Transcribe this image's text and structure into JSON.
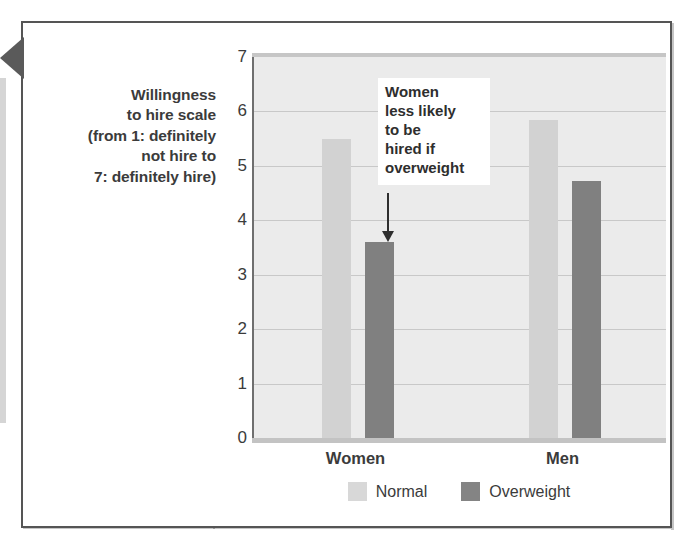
{
  "figure": {
    "axis_caption_lines": [
      "Willingness",
      "to hire scale",
      "(from 1: definitely",
      "not hire to",
      "7: definitely hire)"
    ],
    "callout_lines": [
      "Women",
      "less likely",
      "to be",
      "hired if",
      "overweight"
    ]
  },
  "colors": {
    "normal_bar": "#d2d2d2",
    "overweight_bar": "#808080",
    "plot_background": "#ebebeb",
    "gridline": "#c8c8c8",
    "text": "#3b3b3b",
    "frame": "#555555"
  },
  "chart_data": {
    "type": "bar",
    "title": "",
    "xlabel": "",
    "ylabel": "Willingness to hire scale (from 1: definitely not hire to 7: definitely hire)",
    "categories": [
      "Women",
      "Men"
    ],
    "series": [
      {
        "name": "Normal",
        "values": [
          5.5,
          5.85
        ],
        "color": "#d2d2d2"
      },
      {
        "name": "Overweight",
        "values": [
          3.6,
          4.72
        ],
        "color": "#808080"
      }
    ],
    "ylim": [
      0,
      7
    ],
    "yticks": [
      0,
      1,
      2,
      3,
      4,
      5,
      6,
      7
    ],
    "ytick_labels": [
      "0",
      "1",
      "2",
      "3",
      "4",
      "5",
      "6",
      "7"
    ],
    "grid": true,
    "legend_position": "bottom-center",
    "annotations": [
      {
        "text": "Women less likely to be hired if overweight",
        "target_category": "Women",
        "target_series": "Overweight"
      }
    ]
  }
}
